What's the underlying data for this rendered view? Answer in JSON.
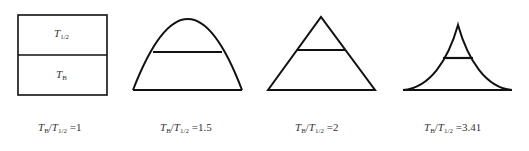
{
  "diagram": {
    "stroke_color": "#111111",
    "panels": [
      {
        "shape": "rectangle",
        "upper_label": {
          "T": "T",
          "sub": "1/2"
        },
        "lower_label": {
          "T": "T",
          "sub": "B"
        },
        "caption": {
          "num": "T",
          "num_sub": "B",
          "den": "T",
          "den_sub": "1/2",
          "value": "=1"
        }
      },
      {
        "shape": "parabola",
        "caption": {
          "num": "T",
          "num_sub": "B",
          "den": "T",
          "den_sub": "1/2",
          "value": "=1.5"
        }
      },
      {
        "shape": "triangle",
        "caption": {
          "num": "T",
          "num_sub": "B",
          "den": "T",
          "den_sub": "1/2",
          "value": "=2"
        }
      },
      {
        "shape": "concave-peak",
        "caption": {
          "num": "T",
          "num_sub": "B",
          "den": "T",
          "den_sub": "1/2",
          "value": "=3.41"
        }
      }
    ]
  }
}
